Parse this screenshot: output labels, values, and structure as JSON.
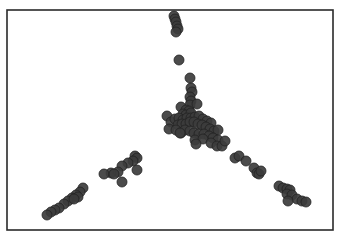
{
  "chart_data": {
    "type": "scatter",
    "title": "",
    "xlabel": "",
    "ylabel": "",
    "grid": false,
    "legend": null,
    "axes_visible": false,
    "frame": {
      "left": 7,
      "top": 10,
      "right": 333,
      "bottom": 230
    },
    "point_color": "#3c3c3c",
    "point_edge_color": "#222222",
    "point_radius": 5,
    "series": [
      {
        "name": "points",
        "points": [
          [
            174,
            16
          ],
          [
            175,
            19
          ],
          [
            176,
            22
          ],
          [
            177,
            26
          ],
          [
            178,
            29
          ],
          [
            176,
            32
          ],
          [
            179,
            60
          ],
          [
            190,
            78
          ],
          [
            191,
            88
          ],
          [
            192,
            92
          ],
          [
            190,
            97
          ],
          [
            191,
            101
          ],
          [
            190,
            105
          ],
          [
            197,
            104
          ],
          [
            181,
            107
          ],
          [
            186,
            110
          ],
          [
            189,
            111
          ],
          [
            183,
            114
          ],
          [
            186,
            115
          ],
          [
            191,
            113
          ],
          [
            167,
            116
          ],
          [
            171,
            122
          ],
          [
            175,
            119
          ],
          [
            179,
            118
          ],
          [
            183,
            120
          ],
          [
            187,
            118
          ],
          [
            191,
            118
          ],
          [
            195,
            117
          ],
          [
            199,
            116
          ],
          [
            203,
            119
          ],
          [
            207,
            121
          ],
          [
            211,
            123
          ],
          [
            178,
            125
          ],
          [
            182,
            124
          ],
          [
            186,
            124
          ],
          [
            190,
            122
          ],
          [
            194,
            122
          ],
          [
            198,
            124
          ],
          [
            202,
            125
          ],
          [
            206,
            127
          ],
          [
            210,
            129
          ],
          [
            214,
            131
          ],
          [
            218,
            130
          ],
          [
            169,
            129
          ],
          [
            176,
            130
          ],
          [
            181,
            133
          ],
          [
            185,
            130
          ],
          [
            190,
            131
          ],
          [
            194,
            133
          ],
          [
            199,
            134
          ],
          [
            204,
            134
          ],
          [
            209,
            136
          ],
          [
            213,
            138
          ],
          [
            218,
            140
          ],
          [
            180,
            133
          ],
          [
            195,
            140
          ],
          [
            203,
            139
          ],
          [
            211,
            143
          ],
          [
            217,
            146
          ],
          [
            222,
            146
          ],
          [
            225,
            141
          ],
          [
            196,
            144
          ],
          [
            235,
            158
          ],
          [
            239,
            156
          ],
          [
            246,
            161
          ],
          [
            254,
            168
          ],
          [
            257,
            173
          ],
          [
            259,
            174
          ],
          [
            261,
            171
          ],
          [
            279,
            186
          ],
          [
            283,
            188
          ],
          [
            287,
            189
          ],
          [
            290,
            190
          ],
          [
            287,
            194
          ],
          [
            292,
            195
          ],
          [
            297,
            199
          ],
          [
            302,
            201
          ],
          [
            306,
            202
          ],
          [
            288,
            201
          ],
          [
            135,
            156
          ],
          [
            137,
            158
          ],
          [
            133,
            161
          ],
          [
            128,
            163
          ],
          [
            122,
            166
          ],
          [
            118,
            172
          ],
          [
            111,
            173
          ],
          [
            104,
            174
          ],
          [
            137,
            170
          ],
          [
            122,
            182
          ],
          [
            114,
            174
          ],
          [
            83,
            188
          ],
          [
            80,
            192
          ],
          [
            76,
            195
          ],
          [
            72,
            198
          ],
          [
            68,
            201
          ],
          [
            64,
            204
          ],
          [
            59,
            208
          ],
          [
            55,
            210
          ],
          [
            51,
            212
          ],
          [
            47,
            215
          ],
          [
            78,
            197
          ],
          [
            74,
            199
          ]
        ]
      }
    ]
  }
}
